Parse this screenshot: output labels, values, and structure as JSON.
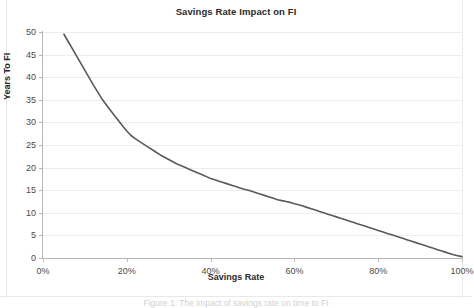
{
  "chart_data": {
    "type": "line",
    "title": "Savings Rate Impact on FI",
    "xlabel": "Savings Rate",
    "ylabel": "Years To FI",
    "xlim": [
      0,
      100
    ],
    "ylim": [
      0,
      50
    ],
    "grid": true,
    "legend": null,
    "x_tick_labels": [
      "0%",
      "20%",
      "40%",
      "60%",
      "80%",
      "100%"
    ],
    "x_tick_values": [
      0,
      20,
      40,
      60,
      80,
      100
    ],
    "y_tick_labels": [
      "0",
      "5",
      "10",
      "15",
      "20",
      "25",
      "30",
      "35",
      "40",
      "45",
      "50"
    ],
    "y_tick_values": [
      0,
      5,
      10,
      15,
      20,
      25,
      30,
      35,
      40,
      45,
      50
    ],
    "series": [
      {
        "name": "Years To FI",
        "color": "#595959",
        "line_width": 1.6,
        "x": [
          5,
          6,
          7,
          8,
          9,
          10,
          11,
          12,
          13,
          14,
          15,
          16,
          17,
          18,
          19,
          20,
          21,
          22,
          23,
          24,
          25,
          26,
          27,
          28,
          29,
          30,
          31,
          32,
          33,
          34,
          35,
          36,
          37,
          38,
          39,
          40,
          41,
          42,
          43,
          44,
          45,
          46,
          47,
          48,
          49,
          50,
          51,
          52,
          53,
          54,
          55,
          56,
          57,
          58,
          59,
          60,
          61,
          62,
          63,
          64,
          65,
          66,
          67,
          68,
          69,
          70,
          71,
          72,
          73,
          74,
          75,
          76,
          77,
          78,
          79,
          80,
          81,
          82,
          83,
          84,
          85,
          86,
          87,
          88,
          89,
          90,
          91,
          92,
          93,
          94,
          95,
          96,
          97,
          98,
          99,
          100
        ],
        "values": [
          49.5,
          47.9,
          46.3,
          44.7,
          43.1,
          41.5,
          39.9,
          38.3,
          36.8,
          35.3,
          34.0,
          32.8,
          31.6,
          30.4,
          29.2,
          28.1,
          27.1,
          26.4,
          25.8,
          25.2,
          24.6,
          24.0,
          23.4,
          22.8,
          22.3,
          21.8,
          21.3,
          20.8,
          20.4,
          20.0,
          19.6,
          19.2,
          18.8,
          18.4,
          18.0,
          17.6,
          17.3,
          17.0,
          16.7,
          16.4,
          16.1,
          15.8,
          15.5,
          15.2,
          15.0,
          14.7,
          14.4,
          14.1,
          13.8,
          13.5,
          13.2,
          12.9,
          12.7,
          12.5,
          12.3,
          12.0,
          11.8,
          11.5,
          11.2,
          10.9,
          10.6,
          10.3,
          10.0,
          9.7,
          9.4,
          9.1,
          8.8,
          8.5,
          8.2,
          7.9,
          7.6,
          7.3,
          7.0,
          6.7,
          6.4,
          6.1,
          5.8,
          5.5,
          5.2,
          4.9,
          4.6,
          4.3,
          4.0,
          3.7,
          3.4,
          3.1,
          2.8,
          2.5,
          2.2,
          1.9,
          1.6,
          1.3,
          1.0,
          0.7,
          0.5,
          0.3
        ]
      }
    ],
    "annotations": []
  },
  "caption": {
    "text": "Figure 1: The impact of savings rate on time to FI"
  }
}
